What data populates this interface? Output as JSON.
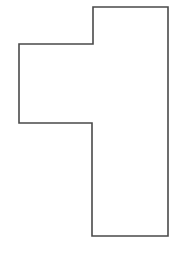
{
  "canvas": {
    "width": 181,
    "height": 257,
    "background": "#ffffff"
  },
  "shape": {
    "kind": "rectilinear-polygon",
    "stroke": "#4a4a4a",
    "stroke_width": 1.6,
    "fill": "#ffffff",
    "points": "93,7 168,7 168,236 92,236 92,123 19,123 19,44 93,44"
  }
}
